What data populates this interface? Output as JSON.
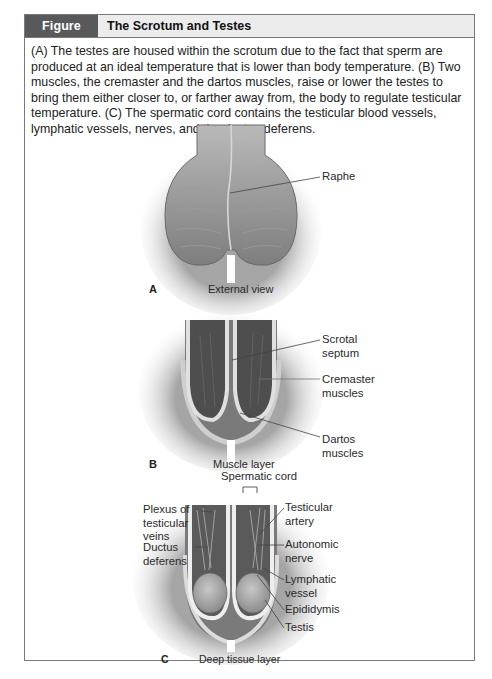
{
  "figure": {
    "number": "Figure 27.25",
    "title": "The Scrotum and Testes",
    "caption": "(A) The testes are housed within the scrotum due to the fact that sperm are produced at an ideal temperature that is lower than body temperature. (B) Two muscles, the cremaster and the dartos muscles, raise or lower the testes to bring them either closer to, or farther away from, the body to regulate testicular temperature. (C) The spermatic cord contains the testicular blood vessels, lymphatic vessels, nerves, and the ductus deferens."
  },
  "panels": [
    {
      "letter": "A",
      "subtitle": "External view",
      "labels": [
        "Raphe"
      ]
    },
    {
      "letter": "B",
      "subtitle": "Muscle layer",
      "labels": [
        "Scrotal septum",
        "Cremaster muscles",
        "Dartos muscles"
      ]
    },
    {
      "letter": "C",
      "subtitle": "Deep tissue layer",
      "top_label": "Spermatic cord",
      "left_labels": [
        "Plexus of testicular veins",
        "Ductus deferens"
      ],
      "right_labels": [
        "Testicular artery",
        "Autonomic nerve",
        "Lymphatic vessel",
        "Epididymis",
        "Testis"
      ]
    }
  ],
  "colors": {
    "header_number_bg": "#58595b",
    "header_bg": "#ececec",
    "border": "#7a7a7a"
  }
}
